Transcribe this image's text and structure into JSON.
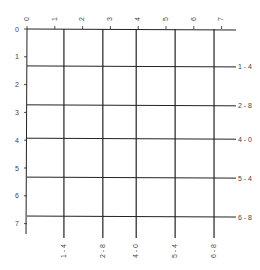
{
  "diagram": {
    "type": "grid",
    "axis_top": {
      "ticks": [
        "0",
        "1",
        "2",
        "3",
        "4",
        "5",
        "6",
        "7"
      ]
    },
    "axis_left": {
      "ticks": [
        "0",
        "1",
        "2",
        "3",
        "4",
        "5",
        "6",
        "7"
      ]
    },
    "vertical_lines": [
      {
        "value": 1.4,
        "label": "1-4"
      },
      {
        "value": 2.8,
        "label": "2-8"
      },
      {
        "value": 4.0,
        "label": "4-0"
      },
      {
        "value": 5.4,
        "label": "5-4"
      },
      {
        "value": 6.8,
        "label": "6-8"
      }
    ],
    "horizontal_lines": [
      {
        "value": 1.4,
        "label": "1-4"
      },
      {
        "value": 2.8,
        "label": "2-8"
      },
      {
        "value": 4.0,
        "label": "4-0"
      },
      {
        "value": 5.4,
        "label": "5-4"
      },
      {
        "value": 6.8,
        "label": "6-8"
      }
    ],
    "colors": {
      "line": "#222222",
      "text": "#444444",
      "background": "#ffffff"
    }
  }
}
